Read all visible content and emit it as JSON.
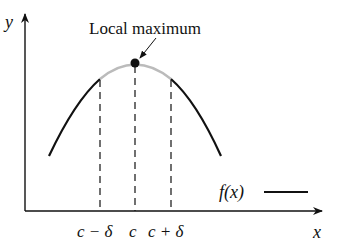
{
  "diagram": {
    "title_annotation": "Local maximum",
    "axis_x_label": "x",
    "axis_y_label": "y",
    "legend": {
      "label": "f(x)"
    },
    "ticks": [
      {
        "label": "c − δ",
        "x": 100
      },
      {
        "label": "c",
        "x": 135
      },
      {
        "label": "c + δ",
        "x": 171
      }
    ],
    "colors": {
      "curve": "#111111",
      "highlight": "#bbbbbb",
      "axes": "#111111"
    }
  }
}
